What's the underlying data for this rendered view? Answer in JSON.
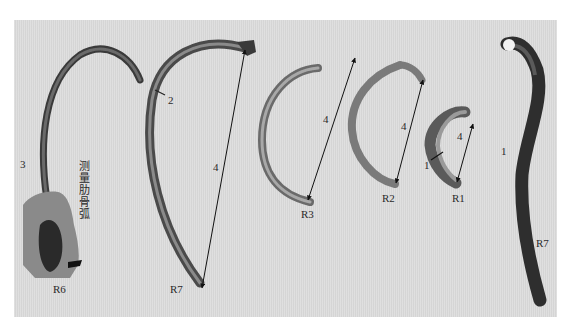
{
  "figure": {
    "background_color": "#dcdcdc",
    "caption_vertical": "测量肋骨弧",
    "specimens": [
      {
        "id": "R6",
        "label": "R6",
        "measure_labels": [
          "3"
        ],
        "note": "held in hand, measuring rib arc"
      },
      {
        "id": "R7-left",
        "label": "R7",
        "measure_labels": [
          "2",
          "4"
        ]
      },
      {
        "id": "R3",
        "label": "R3",
        "measure_labels": [
          "4"
        ]
      },
      {
        "id": "R2",
        "label": "R2",
        "measure_labels": [
          "4"
        ]
      },
      {
        "id": "R1",
        "label": "R1",
        "measure_labels": [
          "1",
          "4"
        ]
      },
      {
        "id": "R7-right",
        "label": "R7",
        "measure_labels": [
          "1"
        ]
      }
    ]
  }
}
